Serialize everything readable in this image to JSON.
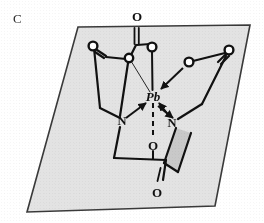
{
  "figure": {
    "panel_label": "C",
    "caption_text": "",
    "kind": "chemical-structure-diagram"
  },
  "colors": {
    "ink": "#111111",
    "plane_fill": "#e3e3e3",
    "plane_stroke": "#3a3a3a",
    "wedge_fill": "#c9c9c9",
    "paper": "#ffffff",
    "label_ink": "#2b2b2b"
  },
  "plane": {
    "name": "reference-plane",
    "points": "78,27 250,25 215,206 27,212"
  },
  "atoms": [
    {
      "id": "Pb",
      "label": "Pb",
      "element": "Pb",
      "style": "italic-text",
      "x": 153,
      "y": 96
    },
    {
      "id": "N1",
      "label": "N",
      "element": "N",
      "style": "bold-text",
      "x": 122,
      "y": 120
    },
    {
      "id": "N2",
      "label": "N",
      "element": "N",
      "style": "bold-text",
      "x": 172,
      "y": 122
    },
    {
      "id": "O_top",
      "label": "O",
      "element": "O",
      "style": "bold-text",
      "x": 137,
      "y": 16
    },
    {
      "id": "O_bottom",
      "label": "O",
      "element": "O",
      "style": "bold-text",
      "x": 163,
      "y": 192
    },
    {
      "id": "O_mid",
      "label": "O",
      "element": "O",
      "style": "bold-text",
      "x": 153,
      "y": 145
    },
    {
      "id": "O_ring1",
      "label": "O",
      "element": "O",
      "style": "open-circle",
      "x": 152,
      "y": 47
    },
    {
      "id": "O_ring2",
      "label": "O",
      "element": "O",
      "style": "open-circle",
      "x": 129,
      "y": 58
    },
    {
      "id": "O_left",
      "label": "O",
      "element": "O",
      "style": "open-circle",
      "x": 93,
      "y": 46
    },
    {
      "id": "O_right1",
      "label": "O",
      "element": "O",
      "style": "open-circle",
      "x": 189,
      "y": 62
    },
    {
      "id": "O_right2",
      "label": "O",
      "element": "O",
      "style": "open-circle",
      "x": 229,
      "y": 50
    }
  ],
  "bond_counts": {
    "plain_bonds": 12,
    "double_bonds": 3,
    "coordination_arrows": 4,
    "dashed_bonds": 1,
    "wedge_bonds": 1
  }
}
